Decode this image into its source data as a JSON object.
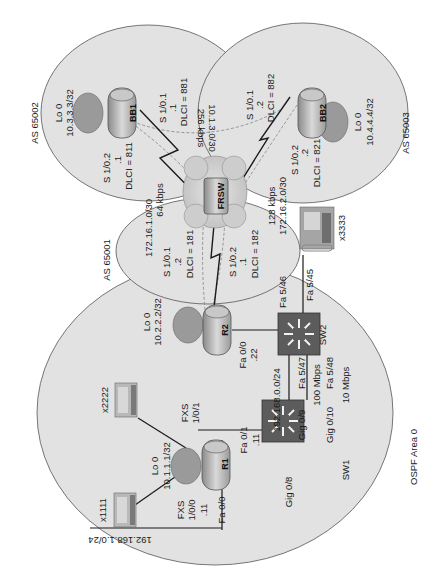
{
  "diagram": {
    "orientation": "rotated-90-ccw",
    "regions": {
      "as65002": {
        "label": "AS 65002"
      },
      "as65003": {
        "label": "AS 65003"
      },
      "as65001": {
        "label": "AS 65001"
      },
      "ospf": {
        "label": "OSPF Area 0"
      }
    },
    "devices": {
      "bb1": {
        "name": "BB1",
        "lo_label": "Lo 0",
        "lo_ip": "10.3.3.3/32"
      },
      "bb2": {
        "name": "BB2",
        "lo_label": "Lo 0",
        "lo_ip": "10.4.4.4/32"
      },
      "frsw": {
        "name": "FRSW"
      },
      "r2": {
        "name": "R2",
        "lo_label": "Lo 0",
        "lo_ip": "10.2.2.2/32"
      },
      "r1": {
        "name": "R1",
        "lo_label": "Lo 0",
        "lo_ip": "10.1.1.1/32"
      },
      "sw1": {
        "name": "SW1"
      },
      "sw2": {
        "name": "SW2"
      },
      "phone_x1111": {
        "name": "x1111"
      },
      "phone_x2222": {
        "name": "x2222"
      },
      "ipphone_x3333": {
        "name": "x3333"
      }
    },
    "links": {
      "bb1_s101": {
        "iface": "S 1/0.1",
        "host": ".1",
        "dlci": "DLCI = 881"
      },
      "bb1_s102": {
        "iface": "S 1/0.2",
        "host": ".1",
        "dlci": "DLCI = 811"
      },
      "bb2_s101": {
        "iface": "S 1/0.1",
        "host": ".2",
        "dlci": "DLCI = 882"
      },
      "bb2_s102": {
        "iface": "S 1/0.2",
        "host": ".2",
        "dlci": "DLCI = 821"
      },
      "r2_s101": {
        "iface": "S 1/0.1",
        "host": ".2",
        "dlci": "DLCI = 181"
      },
      "r2_s102": {
        "iface": "S 1/0.2",
        "host": ".1",
        "dlci": "DLCI = 182"
      },
      "net_bb1_bb2": {
        "subnet": "10.1.3.0/30",
        "speed": "256 kbps"
      },
      "net_r2_bb1": {
        "subnet": "172.16.1.0/30",
        "speed": "64 kbps"
      },
      "net_r2_bb2": {
        "subnet": "172.16.2.0/30",
        "speed": "128 kbps"
      },
      "r2_fa00": {
        "iface": "Fa 0/0",
        "host": ".22"
      },
      "sw2_fa546": {
        "iface": "Fa 5/46"
      },
      "sw2_fa545": {
        "iface": "Fa 5/45"
      },
      "sw2_fa547": {
        "iface": "Fa 5/47"
      },
      "sw2_fa548": {
        "iface": "Fa 5/48"
      },
      "sw1_gig09": {
        "iface": "Gig 0/9"
      },
      "sw1_gig010": {
        "iface": "Gig 0/10"
      },
      "sw1_gig08": {
        "iface": "Gig 0/8"
      },
      "trunk1_speed": {
        "speed": "100 Mbps"
      },
      "trunk2_speed": {
        "speed": "10 Mbps"
      },
      "lan_subnet": {
        "subnet": "192.168.0.0/24"
      },
      "r1_fa01": {
        "iface": "Fa 0/1",
        "host": ".11"
      },
      "r1_fa00": {
        "iface": "Fa 0/0",
        "host": ".11"
      },
      "r1_fxs100": {
        "iface": "FXS",
        "port": "1/0/0"
      },
      "r1_fxs101": {
        "iface": "FXS",
        "port": "1/0/1"
      },
      "lan2_subnet": {
        "subnet": "192.168.1.0/24"
      }
    }
  },
  "colors": {
    "region_fill": "#e2e2e2",
    "region_stroke": "#555555",
    "loopback_fill": "#9a9a9a",
    "switch_fill": "#5c5c5c",
    "cloud_fill": "#cfcfcf",
    "line": "#222222",
    "dashed_line": "#888888"
  }
}
